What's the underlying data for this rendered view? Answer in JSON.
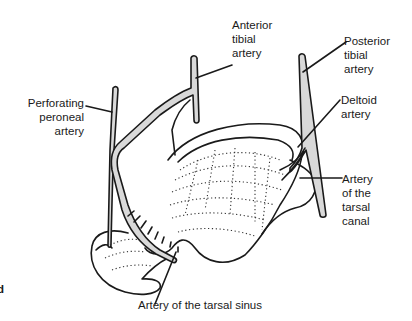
{
  "figure": {
    "type": "anatomical-illustration",
    "labels": {
      "anterior_tibial": "Anterior\ntibial\nartery",
      "posterior_tibial": "Posterior\ntibial\nartery",
      "perforating_peroneal": "Perforating\nperoneal\nartery",
      "deltoid": "Deltoid\nartery",
      "tarsal_canal": "Artery\nof the\ntarsal\ncanal",
      "tarsal_sinus": "Artery of the tarsal sinus",
      "edge_fragment": "d"
    },
    "colors": {
      "ink": "#1a1a1a",
      "vessel_fill": "#d9d9d9",
      "background": "#ffffff"
    }
  }
}
